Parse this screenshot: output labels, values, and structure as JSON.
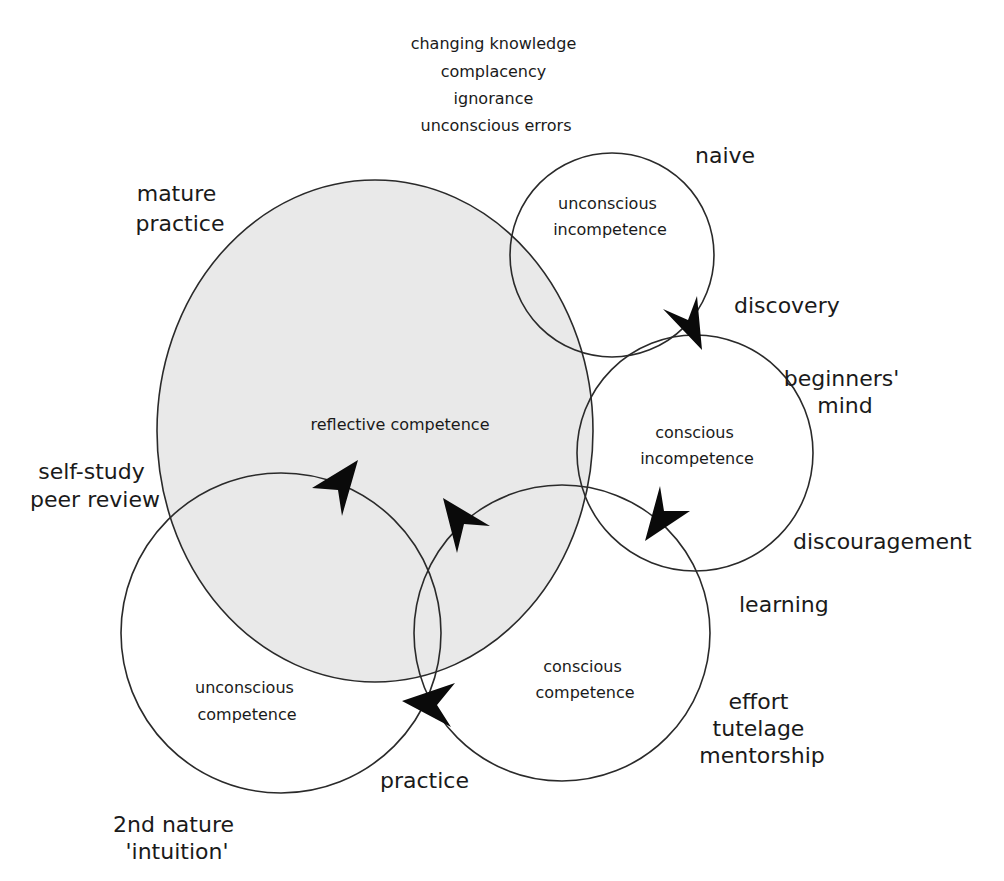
{
  "diagram": {
    "colors": {
      "background": "#ffffff",
      "reflective_fill": "#e9e9e9",
      "stroke": "#2a2a2a",
      "arrow": "#0a0a0a",
      "text": "#1a1a1a"
    },
    "top_annotation": [
      "changing knowledge",
      "complacency",
      "ignorance",
      "unconscious errors"
    ],
    "stages": {
      "reflective": {
        "label": "reflective competence",
        "outer_label": [
          "mature",
          "practice"
        ],
        "side_label": [
          "self-study",
          "peer review"
        ]
      },
      "unconscious_incompetence": {
        "label": [
          "unconscious",
          "incompetence"
        ],
        "outer_label": "naive"
      },
      "conscious_incompetence": {
        "label": [
          "conscious",
          "incompetence"
        ],
        "outer_label": [
          "beginners'",
          "mind"
        ]
      },
      "conscious_competence": {
        "label": [
          "conscious",
          "competence"
        ],
        "outer_label": [
          "effort",
          "tutelage",
          "mentorship"
        ]
      },
      "unconscious_competence": {
        "label": [
          "unconscious",
          "competence"
        ],
        "outer_label": [
          "2nd nature",
          "'intuition'"
        ]
      }
    },
    "transitions": {
      "discovery": "discovery",
      "discouragement": "discouragement",
      "learning": "learning",
      "practice": "practice"
    }
  }
}
